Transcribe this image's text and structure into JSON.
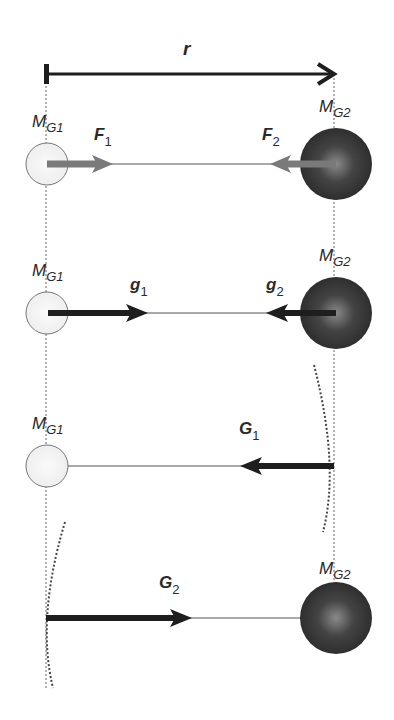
{
  "diagram": {
    "distance_label": "r",
    "colors": {
      "arrow_dark": "#1e1e1e",
      "arrow_gray": "#7a7a7a",
      "small_mass_fill": "#f2f2f2",
      "large_mass_fill": "#3a3a3a",
      "line": "#555555"
    },
    "rows": [
      {
        "id": "force",
        "mass1_label": "M",
        "mass1_sub": "G1",
        "mass2_label": "M",
        "mass2_sub": "G2",
        "vec1_label": "F",
        "vec1_sub": "1",
        "vec2_label": "F",
        "vec2_sub": "2"
      },
      {
        "id": "field",
        "mass1_label": "M",
        "mass1_sub": "G1",
        "mass2_label": "M",
        "mass2_sub": "G2",
        "vec1_label": "g",
        "vec1_sub": "1",
        "vec2_label": "g",
        "vec2_sub": "2"
      },
      {
        "id": "potential1",
        "mass1_label": "M",
        "mass1_sub": "G1",
        "vec_label": "G",
        "vec_sub": "1"
      },
      {
        "id": "potential2",
        "mass2_label": "M",
        "mass2_sub": "G2",
        "vec_label": "G",
        "vec_sub": "2"
      }
    ]
  }
}
